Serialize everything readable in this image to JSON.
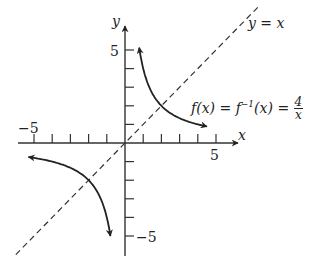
{
  "chart_data": {
    "type": "line",
    "title": "",
    "xlabel": "x",
    "ylabel": "y",
    "xlim": [
      -6.5,
      6.5
    ],
    "ylim": [
      -6,
      6
    ],
    "x_tick_labels": [
      "-5",
      "5"
    ],
    "y_tick_labels": [
      "5",
      "-5"
    ],
    "series": [
      {
        "name": "f(x) = f^-1(x) = 4/x",
        "style": "solid",
        "x": [
          0.8,
          1,
          1.5,
          2,
          3,
          4,
          5,
          5.4
        ],
        "y": [
          5,
          4,
          2.67,
          2,
          1.33,
          1,
          0.8,
          0.74
        ]
      },
      {
        "name": "f(x) = f^-1(x) = 4/x (negative branch)",
        "style": "solid",
        "x": [
          -5.4,
          -5,
          -4,
          -3,
          -2,
          -1.5,
          -1,
          -0.8
        ],
        "y": [
          -0.74,
          -0.8,
          -1,
          -1.33,
          -2,
          -2.67,
          -4,
          -5
        ]
      },
      {
        "name": "y = x",
        "style": "dashed",
        "x": [
          -6,
          7.4
        ],
        "y": [
          -6,
          7.4
        ]
      }
    ],
    "annotations": [
      "y = x",
      "f(x) = f^-1(x) = 4/x"
    ]
  },
  "labels": {
    "y_axis": "y",
    "x_axis": "x",
    "y5": "5",
    "yneg5": "−5",
    "x5": "5",
    "xneg5": "−5",
    "line_label": "y = x",
    "func_label_pre": "f(x) = f",
    "func_label_sup": "−1",
    "func_label_post": "(x) = ",
    "frac_num": "4",
    "frac_den": "x"
  }
}
